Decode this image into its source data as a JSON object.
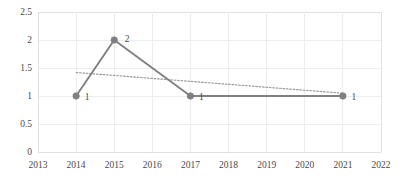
{
  "chart_data": {
    "type": "line",
    "title": "",
    "xlabel": "",
    "ylabel": "",
    "grid": true,
    "legend": "none",
    "xlim": [
      2013,
      2022
    ],
    "ylim": [
      0,
      2.5
    ],
    "x_ticks": [
      "2013",
      "2014",
      "2015",
      "2016",
      "2017",
      "2018",
      "2019",
      "2020",
      "2021",
      "2022"
    ],
    "y_ticks": [
      "0",
      "0.5",
      "1",
      "1.5",
      "2",
      "2.5"
    ],
    "series": [
      {
        "name": "series-1",
        "style": "solid-with-markers",
        "color": "#808080",
        "x": [
          2014,
          2015,
          2017,
          2021
        ],
        "values": [
          1,
          2,
          1,
          1
        ],
        "point_labels": [
          "1",
          "2",
          "1",
          "1"
        ]
      },
      {
        "name": "trendline",
        "style": "dotted",
        "color": "#9a9a9a",
        "x": [
          2014,
          2021
        ],
        "values": [
          1.42,
          1.05
        ]
      }
    ]
  },
  "colors": {
    "series": "#808080",
    "trendline": "#9a9a9a",
    "grid": "#ededed",
    "frame": "#e0e0e0",
    "text": "#4a4a4a",
    "background": "#ffffff"
  },
  "axis": {
    "y_tick_labels": [
      "2.5",
      "2",
      "1.5",
      "1",
      "0.5",
      "0"
    ],
    "x_tick_labels": [
      "2013",
      "2014",
      "2015",
      "2016",
      "2017",
      "2018",
      "2019",
      "2020",
      "2021",
      "2022"
    ]
  },
  "data_labels": [
    {
      "text": "1",
      "x": 2014,
      "y": 1
    },
    {
      "text": "2",
      "x": 2015,
      "y": 2
    },
    {
      "text": "1",
      "x": 2017,
      "y": 1
    },
    {
      "text": "1",
      "x": 2021,
      "y": 1
    }
  ]
}
